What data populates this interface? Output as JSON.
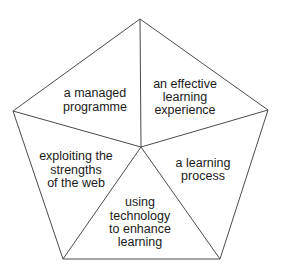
{
  "diagram": {
    "type": "pentagon-segments",
    "center": [
      141,
      147
    ],
    "vertices": [
      [
        140,
        19
      ],
      [
        268,
        110
      ],
      [
        220,
        259
      ],
      [
        63,
        259
      ],
      [
        13,
        111
      ]
    ],
    "stroke_color": "#4a4a4a",
    "text_color": "#1a1a1a",
    "segments": [
      {
        "id": "top-left",
        "lines": [
          "a managed",
          "programme"
        ],
        "x": 95,
        "y": [
          97,
          111
        ]
      },
      {
        "id": "top-right",
        "lines": [
          "an effective",
          "learning",
          "experience"
        ],
        "x": 185,
        "y": [
          88,
          101,
          114
        ]
      },
      {
        "id": "right",
        "lines": [
          "a learning",
          "process"
        ],
        "x": 203,
        "y": [
          167,
          180
        ]
      },
      {
        "id": "bottom",
        "lines": [
          "using",
          "technology",
          "to enhance",
          "learning"
        ],
        "x": 140,
        "y": [
          206,
          220,
          233,
          246
        ]
      },
      {
        "id": "left",
        "lines": [
          "exploiting the",
          "strengths",
          "of the web"
        ],
        "x": 76,
        "y": [
          160,
          174,
          187
        ]
      }
    ]
  }
}
